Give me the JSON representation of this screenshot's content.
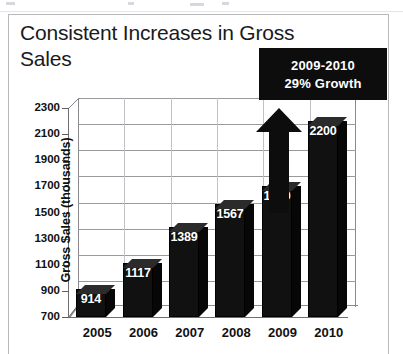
{
  "document": {
    "frame_color": "#b9b9bd",
    "background": "#ffffff"
  },
  "chart_data": {
    "type": "bar",
    "title": "Consistent Increases in Gross\nSales",
    "xlabel": "",
    "ylabel": "Gross Sales (thousands)",
    "categories": [
      "2005",
      "2006",
      "2007",
      "2008",
      "2009",
      "2010"
    ],
    "values": [
      914,
      1117,
      1389,
      1567,
      1700,
      2200
    ],
    "value_labels": [
      "914",
      "1117",
      "1389",
      "1567",
      "1700",
      "2200"
    ],
    "ylim": [
      700,
      2300
    ],
    "yticks": [
      2300,
      2100,
      1900,
      1700,
      1500,
      1300,
      1100,
      900,
      700
    ],
    "ytick_labels": [
      "2300",
      "2100",
      "1900",
      "1700",
      "1500",
      "1300",
      "1100",
      "900",
      "700"
    ],
    "grid": true,
    "legend": false,
    "bar_color": "#111111",
    "label_color": "#ffffff",
    "style": "3d-column",
    "annotation": {
      "line1": "2009-2010",
      "line2": "29% Growth",
      "background": "#0d0d0d",
      "text_color": "#ffffff",
      "points_to": "2009"
    }
  }
}
